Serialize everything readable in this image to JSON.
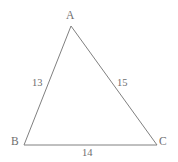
{
  "figure": {
    "type": "triangle-diagram",
    "background_color": "#ffffff",
    "stroke_color": "#808080",
    "text_color": "#6e6e6e",
    "stroke_width": 1,
    "vertices": [
      {
        "name": "A",
        "label": "A",
        "x": 71,
        "y": 26,
        "label_x": 66,
        "label_y": 10
      },
      {
        "name": "B",
        "label": "B",
        "x": 24,
        "y": 145,
        "label_x": 11,
        "label_y": 136
      },
      {
        "name": "C",
        "label": "C",
        "x": 157,
        "y": 145,
        "label_x": 159,
        "label_y": 136
      }
    ],
    "sides": [
      {
        "name": "AB",
        "from": "A",
        "to": "B",
        "label": "13",
        "label_x": 32,
        "label_y": 77
      },
      {
        "name": "AC",
        "from": "A",
        "to": "C",
        "label": "15",
        "label_x": 117,
        "label_y": 77
      },
      {
        "name": "BC",
        "from": "B",
        "to": "C",
        "label": "14",
        "label_x": 82,
        "label_y": 147
      }
    ],
    "polygon_points": "71,26 24,145 157,145"
  },
  "chart_data": {
    "type": "diagram",
    "title": "",
    "shape": "triangle",
    "vertex_labels": [
      "A",
      "B",
      "C"
    ],
    "side_lengths": {
      "AB": 13,
      "AC": 15,
      "BC": 14
    },
    "side_labels": [
      "13",
      "15",
      "14"
    ],
    "vertex_coordinates": {
      "A": [
        71,
        26
      ],
      "B": [
        24,
        145
      ],
      "C": [
        157,
        145
      ]
    },
    "grid": false,
    "legend": "none"
  }
}
